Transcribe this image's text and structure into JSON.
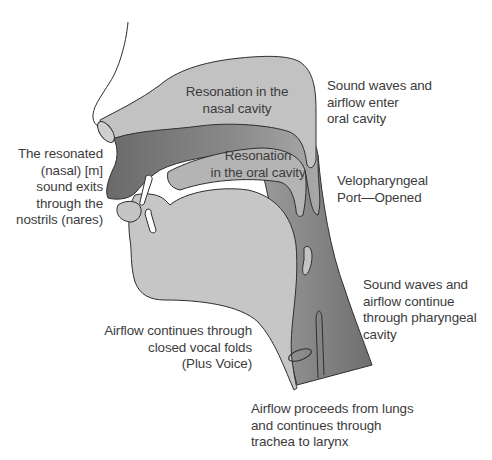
{
  "diagram": {
    "colors": {
      "light_tissue": "#c4c4c4",
      "nasal_cavity": "#bebebe",
      "dark_oral_region": "#6e6e6e",
      "pharynx_dark": "#858585",
      "outline": "#2e2e2e",
      "text": "#3c3c3c"
    },
    "labels": {
      "nasal_cavity": "Resonation in the\nnasal cavity",
      "oral_cavity": "Resonation\nin the oral cavity",
      "nostrils": "The resonated\n(nasal) [m]\nsound exits\nthrough the\nnostrils (nares)",
      "enter_oral": "Sound waves and\nairflow enter\noral cavity",
      "velopharyngeal": "Velopharyngeal\nPort—Opened",
      "pharyngeal": "Sound waves and\nairflow continue\nthrough pharyngeal\ncavity",
      "vocal_folds": "Airflow continues through\nclosed vocal folds\n(Plus Voice)",
      "lungs": "Airflow proceeds from lungs\nand continues through\ntrachea to larynx"
    }
  }
}
